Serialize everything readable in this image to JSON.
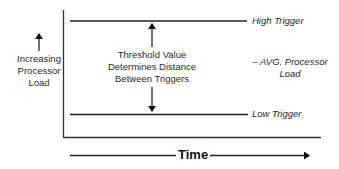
{
  "diagram": {
    "y_axis_label": {
      "line1": "Increasing",
      "line2": "Processor",
      "line3": "Load"
    },
    "x_axis_label": "Time",
    "high_trigger_label": "High Trigger",
    "low_trigger_label": "Low Trigger",
    "avg_label": {
      "line1": "– AVG. Processor",
      "line2": "Load"
    },
    "threshold_label": {
      "line1": "Threshold Value",
      "line2": "Determines Distance",
      "line3": "Between Triggers"
    },
    "colors": {
      "line": "#222222",
      "text": "#2a2a2a"
    }
  }
}
